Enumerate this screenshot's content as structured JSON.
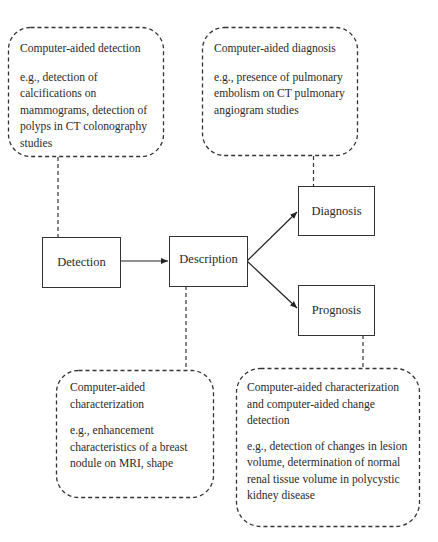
{
  "diagram": {
    "process_nodes": [
      {
        "id": "detection",
        "label": "Detection"
      },
      {
        "id": "description",
        "label": "Description"
      },
      {
        "id": "diagnosis",
        "label": "Diagnosis"
      },
      {
        "id": "prognosis",
        "label": "Prognosis"
      }
    ],
    "annotations": [
      {
        "id": "cad-detection",
        "title": "Computer-aided detection",
        "body": "e.g., detection of calcifications on mammograms, detection of polyps in CT colonography studies",
        "attached_to": "detection"
      },
      {
        "id": "cad-diagnosis",
        "title": "Computer-aided diagnosis",
        "body": "e.g., presence of pulmonary embolism on CT pulmonary angiogram studies",
        "attached_to": "diagnosis"
      },
      {
        "id": "cad-characterization",
        "title": "Computer-aided characterization",
        "body": "e.g., enhancement characteristics of a breast nodule on MRI, shape",
        "attached_to": "description"
      },
      {
        "id": "cad-change-detection",
        "title": "Computer-aided characterization and computer-aided change detection",
        "body": "e.g., detection of changes in lesion volume, determination of normal renal tissue volume in polycystic kidney disease",
        "attached_to": "prognosis"
      }
    ],
    "edges": [
      {
        "from": "detection",
        "to": "description",
        "style": "solid-arrow"
      },
      {
        "from": "description",
        "to": "diagnosis",
        "style": "solid-arrow"
      },
      {
        "from": "description",
        "to": "prognosis",
        "style": "solid-arrow"
      },
      {
        "from": "cad-detection",
        "to": "detection",
        "style": "dashed"
      },
      {
        "from": "cad-diagnosis",
        "to": "diagnosis",
        "style": "dashed"
      },
      {
        "from": "description",
        "to": "cad-characterization",
        "style": "dashed"
      },
      {
        "from": "prognosis",
        "to": "cad-change-detection",
        "style": "dashed"
      }
    ],
    "colors": {
      "stroke": "#333333",
      "text": "#2a2a2a",
      "background": "#ffffff"
    }
  }
}
